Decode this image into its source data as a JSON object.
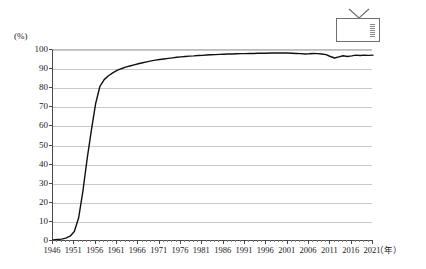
{
  "chart_data": {
    "type": "line",
    "title": "",
    "xlabel": "（年）",
    "ylabel": "(%)",
    "unit_label": "(%)",
    "x_unit_label": "（年）",
    "legend_icon": "television-icon",
    "grid": true,
    "legend_position": "top-right",
    "xlim": [
      1946,
      2021
    ],
    "ylim": [
      0,
      100
    ],
    "y_ticks": [
      100,
      90,
      80,
      70,
      60,
      50,
      40,
      30,
      20,
      10,
      0
    ],
    "x_ticks": [
      1946,
      1951,
      1956,
      1961,
      1966,
      1971,
      1976,
      1981,
      1986,
      1991,
      1996,
      2001,
      2006,
      2011,
      2016,
      2021
    ],
    "x_tick_interval_minor": 1,
    "x_tick_interval_major": 5,
    "series": [
      {
        "name": "テレビ普及率",
        "color": "#111111",
        "x": [
          1946,
          1947,
          1948,
          1949,
          1950,
          1951,
          1952,
          1953,
          1954,
          1955,
          1956,
          1957,
          1958,
          1959,
          1960,
          1961,
          1962,
          1963,
          1964,
          1965,
          1966,
          1967,
          1968,
          1969,
          1970,
          1971,
          1972,
          1973,
          1974,
          1975,
          1976,
          1977,
          1978,
          1979,
          1980,
          1981,
          1982,
          1983,
          1984,
          1985,
          1986,
          1987,
          1988,
          1989,
          1990,
          1991,
          1992,
          1993,
          1994,
          1995,
          1996,
          1997,
          1998,
          1999,
          2000,
          2001,
          2002,
          2003,
          2004,
          2005,
          2006,
          2007,
          2008,
          2009,
          2010,
          2011,
          2012,
          2013,
          2014,
          2015,
          2016,
          2017,
          2018,
          2019,
          2020,
          2021
        ],
        "values": [
          0.5,
          0.8,
          1.0,
          1.5,
          2.5,
          5.0,
          12.0,
          26.0,
          43.0,
          58.0,
          72.0,
          81.0,
          84.5,
          86.5,
          88.0,
          89.3,
          90.2,
          91.0,
          91.6,
          92.2,
          92.8,
          93.3,
          93.8,
          94.3,
          94.7,
          95.0,
          95.3,
          95.6,
          95.9,
          96.2,
          96.4,
          96.6,
          96.8,
          96.9,
          97.1,
          97.2,
          97.4,
          97.5,
          97.6,
          97.7,
          97.8,
          97.9,
          97.9,
          98.0,
          98.1,
          98.1,
          98.2,
          98.2,
          98.3,
          98.3,
          98.3,
          98.4,
          98.4,
          98.4,
          98.4,
          98.4,
          98.3,
          98.2,
          98.1,
          97.9,
          98.0,
          98.2,
          98.1,
          97.9,
          97.6,
          96.6,
          95.8,
          96.4,
          97.0,
          96.6,
          96.9,
          97.3,
          97.1,
          97.3,
          97.2,
          97.3
        ]
      }
    ]
  }
}
